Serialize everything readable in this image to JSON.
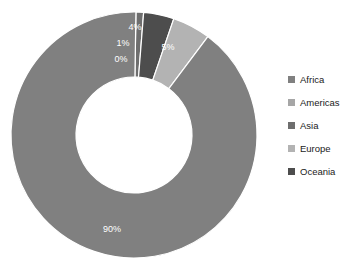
{
  "chart_data": {
    "type": "pie",
    "variant": "donut",
    "title": "",
    "subtitle": "",
    "xlabel": "",
    "ylabel": "",
    "legend_position": "right",
    "grid": false,
    "hole_ratio": 0.47,
    "start_angle_deg": 0,
    "direction": "clockwise",
    "unit": "%",
    "categories": [
      "Africa",
      "Americas",
      "Asia",
      "Europe",
      "Oceania"
    ],
    "values": [
      90,
      0,
      1,
      5,
      4
    ],
    "labels": [
      "90%",
      "0%",
      "1%",
      "5%",
      "4%"
    ],
    "colors": [
      "#808080",
      "#a6a6a6",
      "#6e6e6e",
      "#b3b3b3",
      "#4d4d4d"
    ],
    "slices": [
      {
        "name": "Africa",
        "value": 90,
        "label": "90%",
        "color": "#808080"
      },
      {
        "name": "Americas",
        "value": 0,
        "label": "0%",
        "color": "#a6a6a6"
      },
      {
        "name": "Asia",
        "value": 1,
        "label": "1%",
        "color": "#6e6e6e"
      },
      {
        "name": "Europe",
        "value": 5,
        "label": "5%",
        "color": "#b3b3b3"
      },
      {
        "name": "Oceania",
        "value": 4,
        "label": "4%",
        "color": "#4d4d4d"
      }
    ]
  },
  "legend": {
    "items": [
      {
        "label": "Africa",
        "color": "#808080"
      },
      {
        "label": "Americas",
        "color": "#a6a6a6"
      },
      {
        "label": "Asia",
        "color": "#6e6e6e"
      },
      {
        "label": "Europe",
        "color": "#b3b3b3"
      },
      {
        "label": "Oceania",
        "color": "#4d4d4d"
      }
    ]
  },
  "geometry": {
    "cx": 134,
    "cy": 135,
    "outer_r": 123,
    "inner_r": 58,
    "label_r": 98
  }
}
